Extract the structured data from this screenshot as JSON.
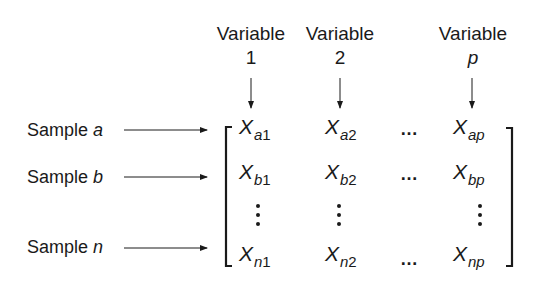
{
  "columns": [
    {
      "header": "Variable",
      "index": "1",
      "index_italic": false
    },
    {
      "header": "Variable",
      "index": "2",
      "index_italic": false
    },
    {
      "header": "Variable",
      "index": "p",
      "index_italic": true
    }
  ],
  "rows": [
    {
      "label_prefix": "Sample ",
      "label_var": "a"
    },
    {
      "label_prefix": "Sample ",
      "label_var": "b"
    },
    {
      "label_prefix": "Sample ",
      "label_var": "n"
    }
  ],
  "matrix": {
    "symbol": "X",
    "cells": [
      [
        {
          "row": "a",
          "col": "1"
        },
        {
          "row": "a",
          "col": "2"
        },
        {
          "row": "a",
          "col": "p"
        }
      ],
      [
        {
          "row": "b",
          "col": "1"
        },
        {
          "row": "b",
          "col": "2"
        },
        {
          "row": "b",
          "col": "p"
        }
      ],
      [
        {
          "row": "n",
          "col": "1"
        },
        {
          "row": "n",
          "col": "2"
        },
        {
          "row": "n",
          "col": "p"
        }
      ]
    ],
    "horizontal_ellipsis": "…"
  },
  "colors": {
    "ink": "#1a1a1a",
    "background": "#ffffff"
  }
}
